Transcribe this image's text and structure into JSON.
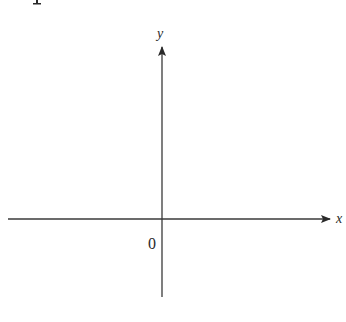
{
  "diagram": {
    "type": "coordinate-axes",
    "x_axis_label": "x",
    "y_axis_label": "y",
    "origin_label": "0",
    "colors": {
      "axis": "#3a3a3a",
      "text": "#2a2a2a",
      "background": "#ffffff"
    }
  },
  "top_fragment": "I"
}
